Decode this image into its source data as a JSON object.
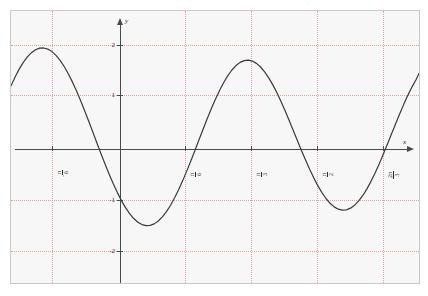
{
  "figure": {
    "background_color": "#f7f7f7",
    "border_color": "#c9c9c9",
    "grid_color": "#d08a8a",
    "axis_color": "#4a4a4a",
    "curve_color": "#3a3a3a"
  },
  "axes": {
    "x_axis_name": "x",
    "y_axis_name": "y"
  },
  "y_ticks": [
    {
      "label": "2",
      "value": 2
    },
    {
      "label": "1",
      "value": 1
    },
    {
      "label": "-1",
      "value": -1
    },
    {
      "label": "-2",
      "value": -2
    }
  ],
  "x_ticks": [
    {
      "sign": "-",
      "numerator": "π",
      "denominator": "6",
      "value": -0.5235987756
    },
    {
      "sign": "",
      "numerator": "π",
      "denominator": "6",
      "value": 0.5235987756
    },
    {
      "sign": "",
      "numerator": "π",
      "denominator": "3",
      "value": 1.0471975512
    },
    {
      "sign": "",
      "numerator": "π",
      "denominator": "2",
      "value": 1.5707963268
    },
    {
      "sign": "",
      "numerator": "2π",
      "denominator": "3",
      "value": 2.0943951024
    }
  ],
  "chart_data": {
    "type": "line",
    "title": "",
    "xlabel": "x",
    "ylabel": "y",
    "function": "y = 2 cos(3x)",
    "amplitude": 2,
    "period": 2.0943951024,
    "xlim": [
      -0.8028514559,
      2.4085543677
    ],
    "ylim": [
      -2.5490196078,
      2.6862745098
    ],
    "grid": true,
    "legend": false,
    "x_gridlines": [
      -0.5235987756,
      0.5235987756,
      1.0471975512,
      1.5707963268,
      2.0943951024
    ],
    "y_gridlines": [
      2,
      1,
      -1,
      -2
    ],
    "x": [
      -0.8028514559,
      -0.7706,
      -0.7384,
      -0.7062,
      -0.674,
      -0.6418,
      -0.6096,
      -0.5774,
      -0.5452,
      -0.513,
      -0.4808,
      -0.4486,
      -0.4164,
      -0.3842,
      -0.352,
      -0.3198,
      -0.2876,
      -0.2554,
      -0.2232,
      -0.191,
      -0.1588,
      -0.1266,
      -0.0944,
      -0.0622,
      -0.03,
      0.0022,
      0.0344,
      0.0666,
      0.0988,
      0.131,
      0.1632,
      0.1954,
      0.2276,
      0.2598,
      0.292,
      0.3242,
      0.3564,
      0.3886,
      0.4208,
      0.453,
      0.4852,
      0.5174,
      0.5496,
      0.5818,
      0.614,
      0.6462,
      0.6784,
      0.7106,
      0.7428,
      0.775,
      0.8072,
      0.8394,
      0.8716,
      0.9038,
      0.936,
      0.9682,
      1.0004,
      1.0326,
      1.0648,
      1.097,
      1.1292,
      1.1614,
      1.1936,
      1.2258,
      1.258,
      1.2902,
      1.3224,
      1.3546,
      1.3868,
      1.419,
      1.4512,
      1.4834,
      1.5156,
      1.5478,
      1.58,
      1.6122,
      1.6444,
      1.6766,
      1.7088,
      1.741,
      1.7732,
      1.8054,
      1.8376,
      1.8698,
      1.902,
      1.9342,
      1.9664,
      1.9986,
      2.0308,
      2.063,
      2.0952,
      2.1274,
      2.1596,
      2.1918,
      2.224,
      2.2562,
      2.2884,
      2.3206,
      2.3528,
      2.385,
      2.4085543677
    ],
    "y": [
      1.2459,
      1.4169,
      1.5679,
      1.6972,
      1.8031,
      1.8846,
      1.9407,
      1.9709,
      1.9749,
      1.9528,
      1.905,
      1.8324,
      1.7361,
      1.6177,
      1.4789,
      1.322,
      1.1493,
      0.9635,
      0.7673,
      0.5637,
      0.3559,
      0.1469,
      -0.0601,
      -0.2622,
      -0.4563,
      -0.6396,
      -0.8095,
      -0.9634,
      -1.0991,
      -1.2146,
      -1.3082,
      -1.3785,
      -1.4245,
      -1.4454,
      -1.4409,
      -1.4111,
      -1.3564,
      -1.2775,
      -1.1756,
      -1.0521,
      -0.9091,
      -0.7487,
      -0.5734,
      -0.3861,
      -0.1897,
      0.0126,
      0.2175,
      0.4214,
      0.621,
      0.8129,
      0.9938,
      1.1607,
      1.3108,
      1.4415,
      1.5506,
      1.6363,
      1.6971,
      1.732,
      1.7404,
      1.7223,
      1.678,
      1.6085,
      1.515,
      1.3995,
      1.264,
      1.1113,
      0.944,
      0.7653,
      0.5784,
      0.3867,
      0.1936,
      0.0026,
      -0.1831,
      -0.36,
      -0.5252,
      -0.6758,
      -0.8091,
      -0.9228,
      -1.0149,
      -1.0838,
      -1.1282,
      -1.1473,
      -1.1407,
      -1.1084,
      -1.0508,
      -0.9689,
      -0.864,
      -0.7379,
      -0.5928,
      -0.4313,
      -0.2562,
      -0.0707,
      0.1217,
      0.3175,
      0.5131,
      0.7048,
      0.8891,
      1.0625,
      1.2216,
      1.3634,
      1.4851
    ]
  }
}
